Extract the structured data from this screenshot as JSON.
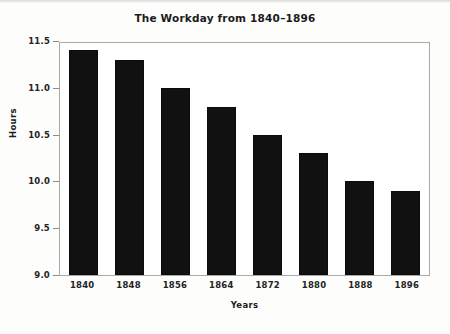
{
  "chart_data": {
    "type": "bar",
    "title": "The Workday from 1840–1896",
    "xlabel": "Years",
    "ylabel": "Hours",
    "categories": [
      "1840",
      "1848",
      "1856",
      "1864",
      "1872",
      "1880",
      "1888",
      "1896"
    ],
    "values": [
      11.4,
      11.3,
      11.0,
      10.8,
      10.5,
      10.3,
      10.0,
      9.9
    ],
    "ylim": [
      9.0,
      11.5
    ],
    "yticks": [
      "9.0",
      "9.5",
      "10.0",
      "10.5",
      "11.0",
      "11.5"
    ],
    "ytick_values": [
      9.0,
      9.5,
      10.0,
      10.5,
      11.0,
      11.5
    ],
    "grid": false,
    "legend": null,
    "bar_color": "#111111",
    "background_color": "#ffffff",
    "frame_color": "#a9a9a7"
  }
}
